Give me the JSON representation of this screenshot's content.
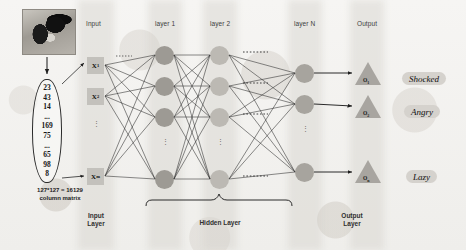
{
  "figure": {
    "photo_alt": "cat-grayscale-photo"
  },
  "matrix": {
    "values": [
      "23",
      "43",
      "14",
      "...",
      "169",
      "75",
      "...",
      "65",
      "98",
      "8"
    ],
    "caption_line1": "127*127 = 16129",
    "caption_line2": "column matrix"
  },
  "headers": {
    "input": "Input",
    "layer1": "layer 1",
    "layer2": "layer 2",
    "layerN": "layer N",
    "output": "Output"
  },
  "bottom_labels": {
    "input_layer": "Input\nLayer",
    "input_layer_l1": "Input",
    "input_layer_l2": "Layer",
    "hidden_layer": "Hidden Layer",
    "output_layer_l1": "Output",
    "output_layer_l2": "Layer"
  },
  "input_nodes": [
    {
      "label": "X",
      "sub": "1"
    },
    {
      "label": "X",
      "sub": "2"
    },
    {
      "label": "X",
      "sub": "m"
    }
  ],
  "ellipsis": "⋮",
  "output_nodes": [
    {
      "label": "O",
      "sub": "1",
      "emotion": "Shocked"
    },
    {
      "label": "O",
      "sub": "2",
      "emotion": "Angry"
    },
    {
      "label": "O",
      "sub": "n",
      "emotion": "Lazy"
    }
  ],
  "layer_node_counts": {
    "layer1": 4,
    "layer2": 4,
    "layerN": 3
  },
  "colors": {
    "background": "#f4f3f1",
    "band": "#d4d2cd",
    "input_node": "#c3c1bc",
    "layer1_node": "#9d9a94",
    "layer2_node": "#bcb9b3",
    "layerN_node": "#a7a49e",
    "output_node": "#a8a5a0",
    "pill": "#d5d2cd",
    "wire": "#2a2a2a",
    "text": "#1a1a1a"
  }
}
